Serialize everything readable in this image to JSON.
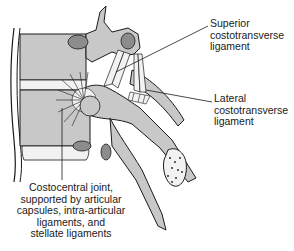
{
  "diagram": {
    "labels": {
      "superior": [
        "Superior",
        "costotransverse",
        "ligament"
      ],
      "lateral": [
        "Lateral",
        "costotransverse",
        "ligament"
      ],
      "costocentral": [
        "Costocentral joint,",
        "supported by articular",
        "capsules, intra-articular",
        "ligaments, and",
        "stellate ligaments"
      ]
    },
    "colors": {
      "bone_fill": "#c8c8c8",
      "cartilage_fill": "#f2f2f2",
      "facet_fill": "#8c8c8c",
      "outline": "#1a1a1a",
      "background": "#ffffff"
    }
  }
}
